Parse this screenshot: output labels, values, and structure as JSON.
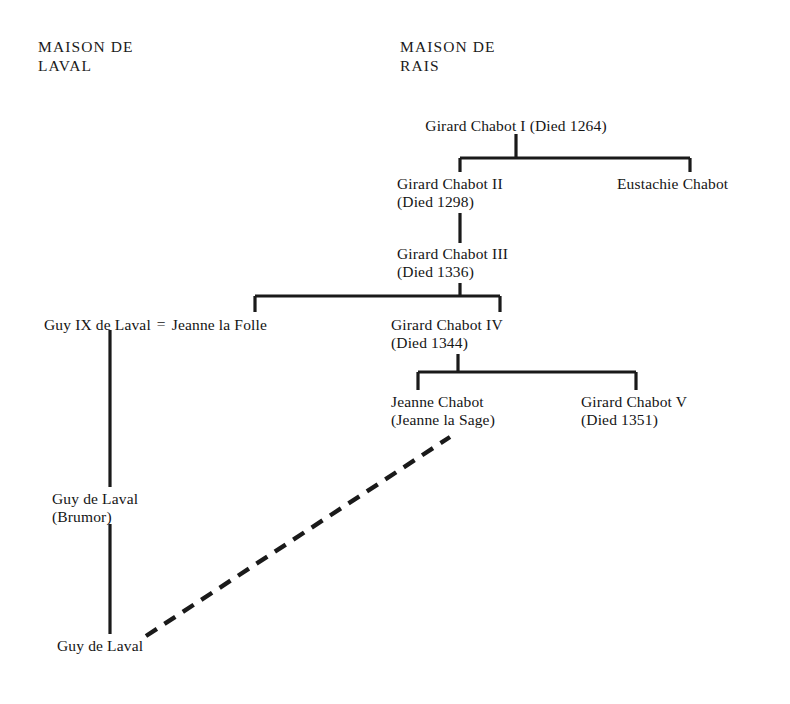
{
  "document": {
    "kind": "genealogical-chart",
    "background_color": "#ffffff",
    "ink_color": "#151515"
  },
  "headings": [
    {
      "id": "maison-de-laval",
      "line1": "MAISON DE",
      "line2": "LAVAL",
      "x": 38,
      "y": 38
    },
    {
      "id": "maison-de-rais",
      "line1": "MAISON DE",
      "line2": "RAIS",
      "x": 400,
      "y": 38
    }
  ],
  "nodes": [
    {
      "id": "girard-chabot-i",
      "line1": "Girard Chabot I (Died 1264)",
      "line2": "",
      "x": 516,
      "y": 117,
      "align": "center"
    },
    {
      "id": "girard-chabot-ii",
      "line1": "Girard Chabot II",
      "line2": "(Died 1298)",
      "x": 397,
      "y": 175,
      "align": "left"
    },
    {
      "id": "eustachie-chabot",
      "line1": "Eustachie Chabot",
      "line2": "",
      "x": 617,
      "y": 175,
      "align": "left"
    },
    {
      "id": "girard-chabot-iii",
      "line1": "Girard Chabot III",
      "line2": "(Died 1336)",
      "x": 397,
      "y": 245,
      "align": "left"
    },
    {
      "id": "girard-chabot-iv",
      "line1": "Girard Chabot IV",
      "line2": "(Died 1344)",
      "x": 391,
      "y": 316,
      "align": "left"
    },
    {
      "id": "jeanne-chabot",
      "line1": "Jeanne Chabot",
      "line2": "(Jeanne la Sage)",
      "x": 391,
      "y": 393,
      "align": "left"
    },
    {
      "id": "girard-chabot-v",
      "line1": "Girard Chabot V",
      "line2": "(Died 1351)",
      "x": 581,
      "y": 393,
      "align": "left"
    },
    {
      "id": "guy-de-laval-brumor",
      "line1": "Guy de Laval",
      "line2": "(Brumor)",
      "x": 52,
      "y": 490,
      "align": "left"
    },
    {
      "id": "guy-de-laval",
      "line1": "Guy de Laval",
      "line2": "",
      "x": 57,
      "y": 637,
      "align": "left"
    }
  ],
  "marriage": {
    "id": "guy-ix-jeanne-la-folle",
    "spouse_left": "Guy IX de Laval",
    "equals_sign": "=",
    "spouse_right": "Jeanne la Folle",
    "x": 44,
    "y": 316
  },
  "connectors": {
    "solid_color": "#1a1a1a",
    "dashed_color": "#1a1a1a",
    "segments": [
      {
        "id": "stem-girard-i",
        "type": "vertical",
        "x": 516,
        "y1": 134,
        "y2": 158
      },
      {
        "id": "bar-generation-ii",
        "type": "horizontal",
        "y": 158,
        "x1": 460,
        "x2": 690
      },
      {
        "id": "drop-girard-ii",
        "type": "vertical",
        "x": 460,
        "y1": 158,
        "y2": 172
      },
      {
        "id": "drop-eustachie",
        "type": "vertical",
        "x": 690,
        "y1": 158,
        "y2": 172
      },
      {
        "id": "stem-girard-ii-to-iii",
        "type": "vertical",
        "x": 460,
        "y1": 213,
        "y2": 243
      },
      {
        "id": "stem-girard-iii",
        "type": "vertical",
        "x": 460,
        "y1": 283,
        "y2": 296
      },
      {
        "id": "bar-generation-iii",
        "type": "horizontal",
        "y": 296,
        "x1": 255,
        "x2": 500
      },
      {
        "id": "drop-jeanne-la-folle",
        "type": "vertical",
        "x": 255,
        "y1": 296,
        "y2": 312
      },
      {
        "id": "drop-girard-iv",
        "type": "vertical",
        "x": 500,
        "y1": 296,
        "y2": 312
      },
      {
        "id": "stem-girard-iv",
        "type": "vertical",
        "x": 458,
        "y1": 354,
        "y2": 372
      },
      {
        "id": "bar-generation-iv",
        "type": "horizontal",
        "y": 372,
        "x1": 418,
        "x2": 636
      },
      {
        "id": "drop-jeanne-chabot",
        "type": "vertical",
        "x": 418,
        "y1": 372,
        "y2": 390
      },
      {
        "id": "drop-girard-v",
        "type": "vertical",
        "x": 636,
        "y1": 372,
        "y2": 390
      },
      {
        "id": "laval-line-upper",
        "type": "vertical",
        "x": 110,
        "y1": 330,
        "y2": 487
      },
      {
        "id": "laval-line-lower",
        "type": "vertical",
        "x": 110,
        "y1": 524,
        "y2": 634
      }
    ],
    "dashed_link": {
      "id": "jeanne-chabot-to-guy-de-laval",
      "x1": 146,
      "y1": 636,
      "x2": 450,
      "y2": 437,
      "dash": "13 9",
      "width": 4.4
    }
  }
}
